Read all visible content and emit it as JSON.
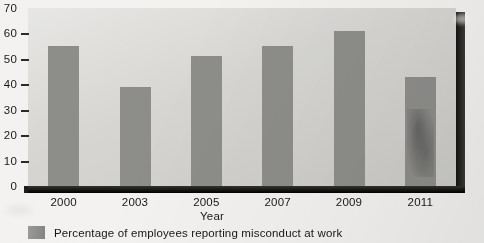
{
  "chart_data": {
    "type": "bar",
    "title": "",
    "subtitle": "",
    "xlabel": "Year",
    "ylabel": "",
    "categories": [
      "2000",
      "2003",
      "2005",
      "2007",
      "2009",
      "2011"
    ],
    "values": [
      55,
      39,
      51,
      55,
      61,
      43
    ],
    "series": [
      {
        "name": "Percentage of employees reporting misconduct at work",
        "values": [
          55,
          39,
          51,
          55,
          61,
          43
        ]
      }
    ],
    "ylim": [
      0,
      70
    ],
    "ytick_step": 10,
    "ytick_labels": [
      "0",
      "10",
      "20",
      "30",
      "40",
      "50",
      "60",
      "70"
    ],
    "ytick_values": [
      0,
      10,
      20,
      30,
      40,
      50,
      60,
      70
    ],
    "grid": false,
    "legend_position": "bottom-left",
    "legend": [
      {
        "label": "Percentage of employees reporting misconduct at work",
        "color": "#8d8d8a",
        "swatch_name": "legend-swatch-misconduct"
      }
    ],
    "annotations": [],
    "colors": {
      "bar": "#8d8d8a",
      "plot_background": "#d4d3cf",
      "page_background": "#f3f2f0",
      "axis": "#1d1d1b",
      "text": "#181816"
    }
  }
}
